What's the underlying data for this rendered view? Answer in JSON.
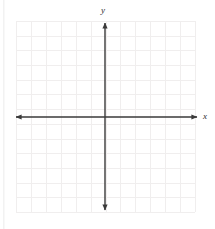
{
  "figure": {
    "kind": "blank-cartesian-coordinate-grid",
    "background_color": "#ffffff",
    "grid": {
      "line_color": "#f0eeee",
      "left": 16,
      "top": 21,
      "right": 195,
      "bottom": 212,
      "columns": 12,
      "rows": 13,
      "cell_width": 14.9,
      "cell_height": 14.7,
      "visible": true
    },
    "axes": {
      "color": "#3a3a3a",
      "stroke_width": 1.4,
      "arrowheads": "both-ends",
      "x_axis": {
        "label": "x",
        "label_style": "italic",
        "y_position": 117,
        "x_start": 15,
        "x_end": 198,
        "tick_labels": [],
        "tick_marks": false
      },
      "y_axis": {
        "label": "y",
        "label_style": "italic",
        "x_position": 105,
        "y_start": 22,
        "y_end": 211,
        "tick_labels": [],
        "tick_marks": false
      },
      "origin": {
        "x": 105,
        "y": 117
      }
    },
    "plotted_data": [],
    "annotations": []
  },
  "chart_data": {
    "type": "scatter",
    "title": "",
    "subtitle": "",
    "xlabel": "x",
    "ylabel": "y",
    "xlim": [
      -6,
      6
    ],
    "ylim": [
      -6.5,
      6.5
    ],
    "xticks": [],
    "yticks": [],
    "grid": true,
    "legend": null,
    "series": [],
    "x": [],
    "values": [],
    "note": "Empty coordinate plane — no data points, curves, or tick labels are drawn."
  }
}
